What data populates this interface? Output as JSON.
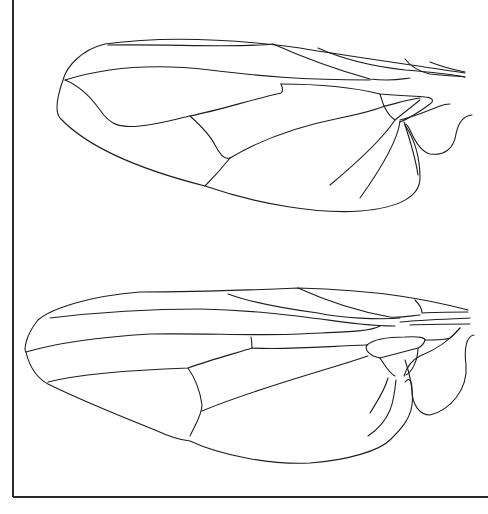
{
  "figure": {
    "background": "#ffffff",
    "line_color": "#1e1e1e",
    "panels": [
      {
        "name": "upper-wing",
        "position": "top"
      },
      {
        "name": "lower-wing",
        "position": "bottom"
      }
    ]
  }
}
